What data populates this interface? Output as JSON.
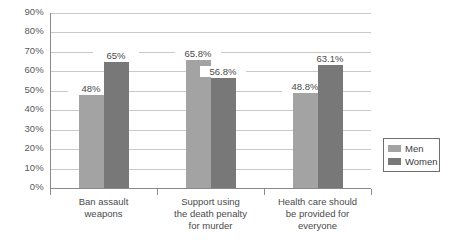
{
  "chart_data": {
    "type": "bar",
    "title": "",
    "subtitle": "",
    "xlabel": "",
    "ylabel": "",
    "ylim": [
      0,
      90
    ],
    "ytick_step": 10,
    "grid": true,
    "legend_position": "right",
    "categories": [
      "Ban assault\nweapons",
      "Support using\nthe death penalty\nfor murder",
      "Health care should\nbe provided for\neveryone"
    ],
    "ytick_labels": [
      "90%",
      "80%",
      "70%",
      "60%",
      "50%",
      "40%",
      "30%",
      "20%",
      "10%",
      "0%"
    ],
    "ytick_values": [
      90,
      80,
      70,
      60,
      50,
      40,
      30,
      20,
      10,
      0
    ],
    "series": [
      {
        "name": "Men",
        "color": "#a3a3a3",
        "values": [
          48,
          65.8,
          48.8
        ],
        "labels": [
          "48%",
          "65.8%",
          "48.8%"
        ]
      },
      {
        "name": "Women",
        "color": "#787878",
        "values": [
          65,
          56.8,
          63.1
        ],
        "labels": [
          "65%",
          "56.8%",
          "63.1%"
        ]
      }
    ]
  },
  "legend": {
    "items": [
      {
        "label": "Men",
        "color": "#a3a3a3"
      },
      {
        "label": "Women",
        "color": "#787878"
      }
    ]
  },
  "colors": {
    "men": "#a3a3a3",
    "women": "#787878",
    "gridline": "#c9c9c9",
    "axis": "#8a8a8a",
    "text": "#4a4a4c",
    "background": "#ffffff"
  }
}
